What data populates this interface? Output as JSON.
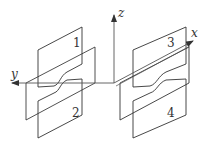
{
  "diagram": {
    "axes": {
      "x": {
        "label": "x"
      },
      "y": {
        "label": "y"
      },
      "z": {
        "label": "z"
      }
    },
    "plates": [
      {
        "id": 1,
        "label": "1"
      },
      {
        "id": 2,
        "label": "2"
      },
      {
        "id": 3,
        "label": "3"
      },
      {
        "id": 4,
        "label": "4"
      }
    ],
    "colors": {
      "line": "#333333",
      "axis": "#555555",
      "background": "#ffffff"
    }
  }
}
